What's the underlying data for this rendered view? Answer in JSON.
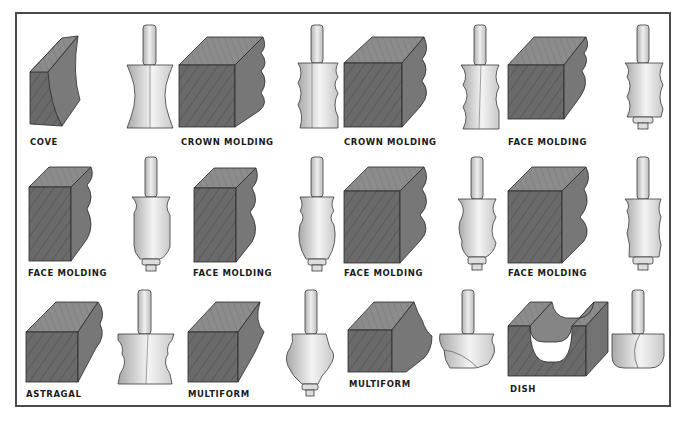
{
  "figure": {
    "type": "router-bit profile chart",
    "rows": [
      {
        "items": [
          {
            "label": "COVE",
            "profile": "cove"
          },
          {
            "label": "CROWN MOLDING",
            "profile": "crown-1"
          },
          {
            "label": "CROWN MOLDING",
            "profile": "crown-2"
          },
          {
            "label": "FACE MOLDING",
            "profile": "face-1"
          }
        ]
      },
      {
        "items": [
          {
            "label": "FACE MOLDING",
            "profile": "face-2"
          },
          {
            "label": "FACE MOLDING",
            "profile": "face-3"
          },
          {
            "label": "FACE MOLDING",
            "profile": "face-4"
          },
          {
            "label": "FACE MOLDING",
            "profile": "face-5"
          }
        ]
      },
      {
        "items": [
          {
            "label": "ASTRAGAL",
            "profile": "astragal"
          },
          {
            "label": "MULTIFORM",
            "profile": "multiform-1"
          },
          {
            "label": "MULTIFORM",
            "profile": "multiform-2"
          },
          {
            "label": "DISH",
            "profile": "dish"
          }
        ]
      }
    ],
    "colors": {
      "border": "#4a4a4a",
      "wood_face": "#6b6b6b",
      "wood_top": "#8a8a8a",
      "wood_side": "#5a5a5a",
      "bit_body": "#e8e8e8",
      "bit_shade": "#b8b8b8",
      "outline": "#2a2a2a"
    }
  }
}
